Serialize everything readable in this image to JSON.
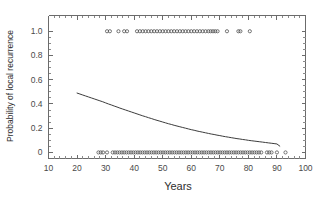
{
  "chart_data": {
    "type": "line",
    "title": "",
    "xlabel": "Years",
    "ylabel": "Probability of local recurrence",
    "xlim": [
      10,
      100
    ],
    "ylim": [
      -0.05,
      1.13
    ],
    "grid": false,
    "legend": "none",
    "x_ticks": [
      10,
      20,
      30,
      40,
      50,
      60,
      70,
      80,
      90,
      100
    ],
    "x_tick_labels": [
      "10",
      "20",
      "30",
      "40",
      "50",
      "60",
      "70",
      "80",
      "90",
      "100"
    ],
    "x_minor_tick_step": 2,
    "y_ticks": [
      0,
      0.2,
      0.4,
      0.6,
      0.8,
      1.0
    ],
    "y_tick_labels": [
      "0",
      "0.2",
      "0.4",
      "0.6",
      "0.8",
      "1.0"
    ],
    "y_minor_tick_step": 0.05,
    "series": [
      {
        "name": "fitted-recurrence-probability",
        "type": "line",
        "color": "#3c3c3c",
        "x": [
          20.0,
          21.0,
          22.0,
          23.0,
          24.0,
          25.0,
          26.0,
          27.0,
          28.0,
          29.0,
          30.0,
          31.0,
          32.0,
          33.0,
          34.0,
          35.0,
          36.0,
          37.0,
          38.0,
          39.0,
          40.0,
          41.0,
          42.0,
          43.0,
          44.0,
          45.0,
          46.0,
          47.0,
          48.0,
          49.0,
          50.0,
          51.0,
          52.0,
          53.0,
          54.0,
          55.0,
          56.0,
          57.0,
          58.0,
          59.0,
          60.0,
          61.0,
          62.0,
          63.0,
          64.0,
          65.0,
          66.0,
          67.0,
          68.0,
          69.0,
          70.0,
          71.0,
          72.0,
          73.0,
          74.0,
          75.0,
          76.0,
          77.0,
          78.0,
          79.0,
          80.0,
          81.0,
          82.0,
          83.0,
          84.0,
          85.0,
          86.0,
          87.0,
          88.0,
          89.0,
          90.0,
          91.0
        ],
        "y": [
          0.49,
          0.482,
          0.474,
          0.466,
          0.458,
          0.45,
          0.442,
          0.434,
          0.426,
          0.418,
          0.409,
          0.4,
          0.392,
          0.383,
          0.375,
          0.366,
          0.358,
          0.35,
          0.342,
          0.334,
          0.326,
          0.318,
          0.31,
          0.302,
          0.295,
          0.287,
          0.28,
          0.272,
          0.265,
          0.258,
          0.251,
          0.244,
          0.237,
          0.231,
          0.224,
          0.218,
          0.212,
          0.206,
          0.2,
          0.194,
          0.188,
          0.183,
          0.177,
          0.172,
          0.167,
          0.162,
          0.157,
          0.152,
          0.148,
          0.143,
          0.139,
          0.134,
          0.13,
          0.126,
          0.122,
          0.118,
          0.114,
          0.111,
          0.107,
          0.104,
          0.1,
          0.097,
          0.094,
          0.091,
          0.088,
          0.085,
          0.082,
          0.079,
          0.076,
          0.073,
          0.07,
          0.052
        ]
      },
      {
        "name": "recurrence-observations",
        "type": "scatter",
        "marker": "open-circle",
        "color": "#4a4a4a",
        "y_value": 1.0,
        "x": [
          30.5,
          31.5,
          34.5,
          36.5,
          37.5,
          41.0,
          42.0,
          43.0,
          44.0,
          45.0,
          46.0,
          47.0,
          48.0,
          49.0,
          50.0,
          51.0,
          52.0,
          53.0,
          54.0,
          55.0,
          56.0,
          57.0,
          58.0,
          59.0,
          60.0,
          61.0,
          62.0,
          63.0,
          64.0,
          65.0,
          66.0,
          66.8,
          67.6,
          68.4,
          69.2,
          72.5,
          76.5,
          77.2,
          80.5
        ]
      },
      {
        "name": "no-recurrence-observations",
        "type": "scatter",
        "marker": "open-circle",
        "color": "#4a4a4a",
        "y_value": 0.0,
        "x": [
          27.5,
          28.3,
          29.1,
          30.5,
          32.5,
          33.3,
          34.1,
          34.9,
          35.7,
          36.5,
          37.3,
          38.1,
          38.9,
          39.7,
          40.5,
          41.3,
          42.1,
          42.9,
          43.7,
          44.5,
          45.3,
          46.1,
          46.9,
          47.7,
          48.5,
          49.3,
          50.1,
          50.9,
          51.7,
          52.5,
          53.3,
          54.1,
          54.9,
          55.7,
          56.5,
          57.3,
          58.1,
          58.9,
          59.7,
          60.5,
          61.3,
          62.1,
          62.9,
          63.7,
          64.5,
          65.3,
          66.1,
          66.9,
          67.7,
          68.5,
          69.3,
          70.1,
          70.9,
          71.7,
          72.5,
          73.3,
          74.1,
          74.9,
          75.7,
          76.5,
          77.3,
          78.1,
          78.9,
          79.7,
          80.5,
          81.3,
          82.1,
          82.9,
          83.7,
          84.5,
          86.5,
          87.3,
          88.1,
          90.0,
          93.0
        ]
      }
    ]
  },
  "axes": {
    "x_title": "Years",
    "y_title": "Probability of local recurrence"
  }
}
